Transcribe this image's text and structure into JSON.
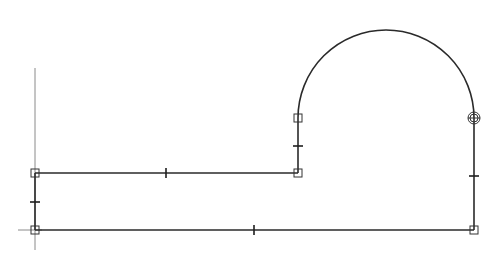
{
  "drawing": {
    "type": "cad-polyline-profile",
    "colors": {
      "background": "#ffffff",
      "stroke": "#2a2a2a",
      "axis": "#8a8a8a"
    },
    "axes": {
      "vertical": {
        "x": 35,
        "y1": 68,
        "y2": 250
      },
      "horizontal": {
        "y": 230,
        "x1": 18,
        "x2": 42
      }
    },
    "segments": [
      {
        "name": "top-left-line",
        "x1": 35,
        "y1": 173,
        "x2": 298,
        "y2": 173,
        "tick": [
          166,
          173,
          "v"
        ]
      },
      {
        "name": "left-short-line",
        "x1": 35,
        "y1": 173,
        "x2": 35,
        "y2": 230,
        "tick": [
          35,
          202,
          "h"
        ]
      },
      {
        "name": "bottom-line",
        "x1": 35,
        "y1": 230,
        "x2": 474,
        "y2": 230,
        "tick": [
          254,
          230,
          "v"
        ]
      },
      {
        "name": "right-vertical-line",
        "x1": 474,
        "y1": 118,
        "x2": 474,
        "y2": 230,
        "tick": [
          474,
          176,
          "h"
        ]
      },
      {
        "name": "arch-left-line",
        "x1": 298,
        "y1": 118,
        "x2": 298,
        "y2": 173,
        "tick": [
          298,
          146,
          "h"
        ]
      }
    ],
    "arc": {
      "cx": 386,
      "cy": 118,
      "r": 88,
      "from": [
        298,
        118
      ],
      "to": [
        474,
        118
      ]
    },
    "grips": [
      {
        "x": 35,
        "y": 173,
        "kind": "square"
      },
      {
        "x": 35,
        "y": 230,
        "kind": "square"
      },
      {
        "x": 298,
        "y": 173,
        "kind": "square"
      },
      {
        "x": 298,
        "y": 118,
        "kind": "square"
      },
      {
        "x": 474,
        "y": 230,
        "kind": "square"
      },
      {
        "x": 474,
        "y": 118,
        "kind": "circle"
      }
    ]
  }
}
